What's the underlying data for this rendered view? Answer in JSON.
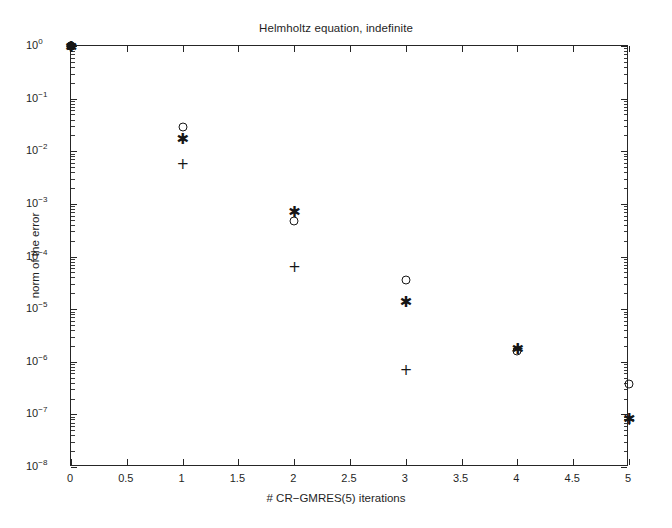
{
  "chart_data": {
    "type": "scatter",
    "title": "Helmholtz equation, indefinite",
    "xlabel": "# CR−GMRES(5) iterations",
    "ylabel": "norm of the error",
    "xlim": [
      0,
      5
    ],
    "ylim": [
      1e-08,
      1
    ],
    "yscale": "log",
    "xscale": "linear",
    "grid": false,
    "legend": "none",
    "xticks": [
      0,
      0.5,
      1,
      1.5,
      2,
      2.5,
      3,
      3.5,
      4,
      4.5,
      5
    ],
    "xticklabels": [
      "0",
      "0.5",
      "1",
      "1.5",
      "2",
      "2.5",
      "3",
      "3.5",
      "4",
      "4.5",
      "5"
    ],
    "yticks": [
      1,
      0.1,
      0.01,
      0.001,
      0.0001,
      1e-05,
      1e-06,
      1e-07,
      1e-08
    ],
    "yticklabels": [
      "10^0",
      "10^-1",
      "10^-2",
      "10^-3",
      "10^-4",
      "10^-5",
      "10^-6",
      "10^-7",
      "10^-8"
    ],
    "yticklabel_parts": [
      {
        "base": "10",
        "exp": "0"
      },
      {
        "base": "10",
        "exp": "−1"
      },
      {
        "base": "10",
        "exp": "−2"
      },
      {
        "base": "10",
        "exp": "−3"
      },
      {
        "base": "10",
        "exp": "−4"
      },
      {
        "base": "10",
        "exp": "−5"
      },
      {
        "base": "10",
        "exp": "−6"
      },
      {
        "base": "10",
        "exp": "−7"
      },
      {
        "base": "10",
        "exp": "−8"
      }
    ],
    "series": [
      {
        "name": "circle-series",
        "marker": "o",
        "x": [
          0,
          1,
          2,
          3,
          4,
          5
        ],
        "y": [
          1.0,
          0.029,
          0.00048,
          3.5e-05,
          1.6e-06,
          3.7e-07
        ]
      },
      {
        "name": "asterisk-series",
        "marker": "*",
        "x": [
          0,
          1,
          2,
          3,
          4,
          5
        ],
        "y": [
          1.0,
          0.018,
          0.00072,
          1.4e-05,
          1.8e-06,
          8.5e-08
        ]
      },
      {
        "name": "plus-series",
        "marker": "+",
        "x": [
          0,
          1,
          2,
          3,
          4,
          5
        ],
        "y": [
          1.0,
          0.006,
          6.5e-05,
          7.4e-07,
          1.8e-06,
          8.2e-08
        ]
      }
    ],
    "colors": {
      "axis": "#262626",
      "marker": "#161616",
      "background": "#ffffff"
    }
  }
}
